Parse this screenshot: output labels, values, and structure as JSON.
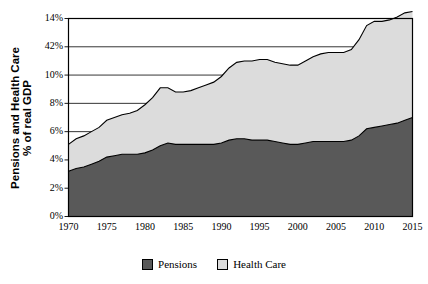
{
  "chart_data": {
    "type": "area",
    "stacked": true,
    "title": "",
    "xlabel": "",
    "ylabel": "Pensions and Health Care % of real GDP",
    "ylabel_lines": [
      "Pensions and Health Care",
      "% of real GDP"
    ],
    "xlim": [
      1970,
      2015
    ],
    "ylim": [
      0,
      14
    ],
    "grid": "horizontal",
    "legend_position": "bottom",
    "ytick_labels": [
      "0%",
      "2%",
      "4%",
      "6%",
      "8%",
      "10%",
      "42%",
      "14%"
    ],
    "ytick_values": [
      0,
      2,
      4,
      6,
      8,
      10,
      12,
      14
    ],
    "xtick_labels": [
      "1970",
      "1975",
      "1980",
      "1985",
      "1990",
      "1995",
      "2000",
      "2005",
      "2010",
      "2015"
    ],
    "xtick_values": [
      1970,
      1975,
      1980,
      1985,
      1990,
      1995,
      2000,
      2005,
      2010,
      2015
    ],
    "colors": {
      "pensions": "#595959",
      "health_care": "#dcdcdc",
      "outline": "#000000",
      "gridline": "#000000",
      "background": "#ffffff"
    },
    "x": [
      1970,
      1971,
      1972,
      1973,
      1974,
      1975,
      1976,
      1977,
      1978,
      1979,
      1980,
      1981,
      1982,
      1983,
      1984,
      1985,
      1986,
      1987,
      1988,
      1989,
      1990,
      1991,
      1992,
      1993,
      1994,
      1995,
      1996,
      1997,
      1998,
      1999,
      2000,
      2001,
      2002,
      2003,
      2004,
      2005,
      2006,
      2007,
      2008,
      2009,
      2010,
      2011,
      2012,
      2013,
      2014,
      2015
    ],
    "series": [
      {
        "name": "Pensions",
        "values": [
          3.2,
          3.4,
          3.5,
          3.7,
          3.9,
          4.2,
          4.3,
          4.4,
          4.4,
          4.4,
          4.5,
          4.7,
          5.0,
          5.2,
          5.1,
          5.1,
          5.1,
          5.1,
          5.1,
          5.1,
          5.2,
          5.4,
          5.5,
          5.5,
          5.4,
          5.4,
          5.4,
          5.3,
          5.2,
          5.1,
          5.1,
          5.2,
          5.3,
          5.3,
          5.3,
          5.3,
          5.3,
          5.4,
          5.7,
          6.2,
          6.3,
          6.4,
          6.5,
          6.6,
          6.8,
          7.0
        ]
      },
      {
        "name": "Health Care",
        "values": [
          1.9,
          2.1,
          2.2,
          2.3,
          2.4,
          2.6,
          2.7,
          2.8,
          2.9,
          3.1,
          3.4,
          3.7,
          4.1,
          3.9,
          3.7,
          3.7,
          3.8,
          4.0,
          4.2,
          4.4,
          4.7,
          5.1,
          5.4,
          5.5,
          5.6,
          5.7,
          5.7,
          5.6,
          5.6,
          5.6,
          5.6,
          5.8,
          6.0,
          6.2,
          6.3,
          6.3,
          6.3,
          6.4,
          6.8,
          7.3,
          7.5,
          7.4,
          7.4,
          7.5,
          7.6,
          7.5
        ]
      }
    ],
    "totals": [
      5.1,
      5.5,
      5.7,
      6.0,
      6.3,
      6.8,
      7.0,
      7.2,
      7.3,
      7.5,
      7.9,
      8.4,
      9.1,
      9.1,
      8.8,
      8.8,
      8.9,
      9.1,
      9.3,
      9.5,
      9.9,
      10.5,
      10.9,
      11.0,
      11.0,
      11.1,
      11.1,
      10.9,
      10.8,
      10.7,
      10.7,
      11.0,
      11.3,
      11.5,
      11.6,
      11.6,
      11.6,
      11.8,
      12.5,
      13.5,
      13.8,
      13.8,
      13.9,
      14.1,
      14.4,
      14.5
    ]
  },
  "legend": {
    "items": [
      {
        "label": "Pensions",
        "color": "#595959"
      },
      {
        "label": "Health Care",
        "color": "#dcdcdc"
      }
    ]
  }
}
